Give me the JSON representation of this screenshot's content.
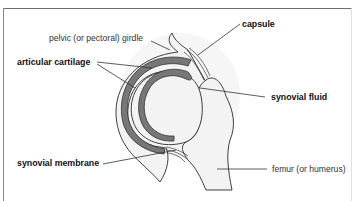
{
  "figure": {
    "type": "anatomical-diagram",
    "frame_color": "#6e6e6e",
    "bone_fill": "#f3f3f3",
    "cartilage_color": "#777777"
  },
  "labels": {
    "girdle": "pelvic (or pectoral) girdle",
    "capsule": "capsule",
    "articular_cartilage": "articular cartilage",
    "synovial_fluid": "synovial fluid",
    "synovial_membrane": "synovial membrane",
    "femur": "femur (or humerus)"
  }
}
